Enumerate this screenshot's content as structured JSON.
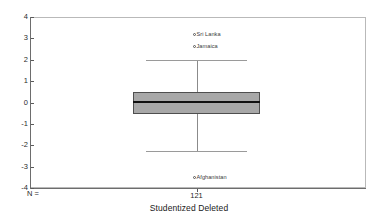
{
  "chart_data": {
    "type": "box",
    "title": "",
    "xlabel": "Studentized Deleted",
    "ylabel": "",
    "ylim": [
      -4,
      4
    ],
    "grid": false,
    "legend": "none",
    "y_ticks": [
      {
        "value": 4,
        "label": "4"
      },
      {
        "value": 3,
        "label": "3"
      },
      {
        "value": 2,
        "label": "2"
      },
      {
        "value": 1,
        "label": "1"
      },
      {
        "value": 0,
        "label": "0"
      },
      {
        "value": -1,
        "label": "-1"
      },
      {
        "value": -2,
        "label": "-2"
      },
      {
        "value": -3,
        "label": "-3"
      },
      {
        "value": -4,
        "label": "-4"
      }
    ],
    "categories": [
      "Studentized Deleted"
    ],
    "n_prefix": "N =",
    "boxes": [
      {
        "category": "Studentized Deleted",
        "n": "121",
        "q1": -0.55,
        "median": 0.03,
        "q3": 0.5,
        "whisker_low": -2.25,
        "whisker_high": 1.97,
        "outliers": [
          {
            "label": "Sri Lanka",
            "value": 3.2
          },
          {
            "label": "Jamaica",
            "value": 2.65
          },
          {
            "label": "Afghanistan",
            "value": -3.5
          }
        ]
      }
    ],
    "colors": {
      "box_fill": "#a8a8a8",
      "box_border": "#4f4f4f",
      "median": "#111111",
      "whisker": "#8b8b8b",
      "axis": "#6d6d6d",
      "frame": "#b9b9b9",
      "text": "#1a1a1a"
    }
  }
}
